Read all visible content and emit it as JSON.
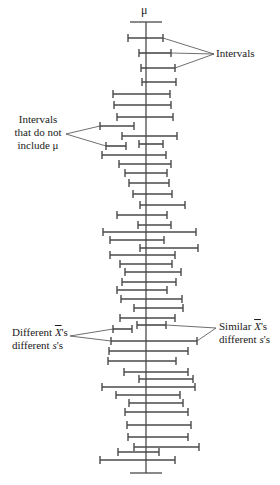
{
  "diagram": {
    "type": "confidence-interval-illustration",
    "mu_label": "μ",
    "mu_x": 146,
    "axis_top": 22,
    "axis_bottom": 473,
    "mu_cap_half_width": 16,
    "line_color": "#4a4a4a",
    "cap_height": 8,
    "annotations": {
      "intervals": "Intervals",
      "not_include_line1": "Intervals",
      "not_include_line2": "that do not",
      "not_include_line3": "include μ",
      "different_x_prefix": "Different ",
      "different_x_symbol": "X",
      "different_x_suffix": "'s",
      "different_x_line2_prefix": "different ",
      "different_x_line2_symbol": "s",
      "different_x_line2_suffix": "'s",
      "similar_x_prefix": "Similar ",
      "similar_x_symbol": "X",
      "similar_x_suffix": "'s",
      "similar_x_line2_prefix": "different ",
      "similar_x_line2_symbol": "s",
      "similar_x_line2_suffix": "'s"
    },
    "intervals": [
      {
        "y": 38,
        "x1": 128,
        "x2": 163
      },
      {
        "y": 53,
        "x1": 139,
        "x2": 171
      },
      {
        "y": 68,
        "x1": 141,
        "x2": 175
      },
      {
        "y": 82,
        "x1": 142,
        "x2": 176
      },
      {
        "y": 94,
        "x1": 113,
        "x2": 170
      },
      {
        "y": 105,
        "x1": 114,
        "x2": 171
      },
      {
        "y": 117,
        "x1": 117,
        "x2": 173
      },
      {
        "y": 126,
        "x1": 100,
        "x2": 134
      },
      {
        "y": 136,
        "x1": 122,
        "x2": 177
      },
      {
        "y": 146,
        "x1": 106,
        "x2": 126
      },
      {
        "y": 144,
        "x1": 139,
        "x2": 163
      },
      {
        "y": 155,
        "x1": 102,
        "x2": 166
      },
      {
        "y": 164,
        "x1": 119,
        "x2": 171
      },
      {
        "y": 173,
        "x1": 125,
        "x2": 167
      },
      {
        "y": 183,
        "x1": 129,
        "x2": 169
      },
      {
        "y": 194,
        "x1": 133,
        "x2": 172
      },
      {
        "y": 205,
        "x1": 140,
        "x2": 185
      },
      {
        "y": 215,
        "x1": 117,
        "x2": 167
      },
      {
        "y": 225,
        "x1": 138,
        "x2": 171
      },
      {
        "y": 232,
        "x1": 103,
        "x2": 196
      },
      {
        "y": 240,
        "x1": 110,
        "x2": 164
      },
      {
        "y": 248,
        "x1": 140,
        "x2": 198
      },
      {
        "y": 255,
        "x1": 110,
        "x2": 175
      },
      {
        "y": 264,
        "x1": 120,
        "x2": 172
      },
      {
        "y": 272,
        "x1": 125,
        "x2": 181
      },
      {
        "y": 282,
        "x1": 122,
        "x2": 176
      },
      {
        "y": 290,
        "x1": 117,
        "x2": 167
      },
      {
        "y": 299,
        "x1": 121,
        "x2": 182
      },
      {
        "y": 308,
        "x1": 134,
        "x2": 183
      },
      {
        "y": 318,
        "x1": 120,
        "x2": 175
      },
      {
        "y": 325,
        "x1": 137,
        "x2": 166
      },
      {
        "y": 329,
        "x1": 113,
        "x2": 132
      },
      {
        "y": 341,
        "x1": 111,
        "x2": 197
      },
      {
        "y": 351,
        "x1": 109,
        "x2": 188
      },
      {
        "y": 361,
        "x1": 108,
        "x2": 176
      },
      {
        "y": 372,
        "x1": 124,
        "x2": 188
      },
      {
        "y": 379,
        "x1": 139,
        "x2": 193
      },
      {
        "y": 387,
        "x1": 102,
        "x2": 195
      },
      {
        "y": 395,
        "x1": 116,
        "x2": 180
      },
      {
        "y": 403,
        "x1": 129,
        "x2": 183
      },
      {
        "y": 412,
        "x1": 125,
        "x2": 188
      },
      {
        "y": 425,
        "x1": 127,
        "x2": 191
      },
      {
        "y": 437,
        "x1": 128,
        "x2": 188
      },
      {
        "y": 447,
        "x1": 134,
        "x2": 199
      },
      {
        "y": 452,
        "x1": 118,
        "x2": 159
      },
      {
        "y": 460,
        "x1": 100,
        "x2": 175
      }
    ],
    "leader_lines": [
      {
        "from": [
          214,
          54
        ],
        "to": [
          163,
          38
        ]
      },
      {
        "from": [
          214,
          54
        ],
        "to": [
          171,
          53
        ]
      },
      {
        "from": [
          214,
          54
        ],
        "to": [
          175,
          68
        ]
      },
      {
        "from": [
          66,
          134
        ],
        "to": [
          100,
          126
        ]
      },
      {
        "from": [
          66,
          134
        ],
        "to": [
          106,
          146
        ]
      },
      {
        "from": [
          70,
          336
        ],
        "to": [
          113,
          329
        ]
      },
      {
        "from": [
          70,
          336
        ],
        "to": [
          111,
          341
        ]
      },
      {
        "from": [
          216,
          328
        ],
        "to": [
          166,
          325
        ]
      },
      {
        "from": [
          216,
          328
        ],
        "to": [
          197,
          341
        ]
      }
    ]
  }
}
